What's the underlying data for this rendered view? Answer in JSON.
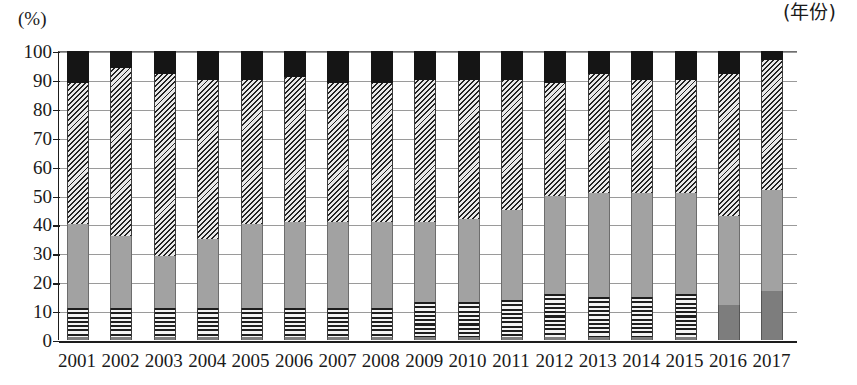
{
  "chart_data": {
    "type": "bar",
    "stacked": true,
    "title": "",
    "subtitle": "",
    "xlabel": "(年份)",
    "ylabel": "(%)",
    "ylim": [
      0,
      100
    ],
    "yticks": [
      0,
      10,
      20,
      30,
      40,
      50,
      60,
      70,
      80,
      90,
      100
    ],
    "ytick_labels": [
      "0",
      "10",
      "20",
      "30",
      "40",
      "50",
      "60",
      "70",
      "80",
      "90",
      "100"
    ],
    "grid": true,
    "legend": "none",
    "categories": [
      "2001",
      "2002",
      "2003",
      "2004",
      "2005",
      "2006",
      "2007",
      "2008",
      "2009",
      "2010",
      "2011",
      "2012",
      "2013",
      "2014",
      "2015",
      "2016",
      "2017"
    ],
    "series": [
      {
        "name": "bottom-dark-gray",
        "pattern": "solid-dark-gray",
        "color": "#7d7d7d",
        "values": [
          1,
          1,
          1,
          1,
          1,
          1,
          1,
          1,
          1,
          1,
          1,
          1,
          1,
          1,
          1,
          12,
          17
        ]
      },
      {
        "name": "horizontal-stripe",
        "pattern": "horizontal-stripes",
        "color": "#1e1e1e",
        "values": [
          10,
          10,
          10,
          10,
          10,
          10,
          10,
          10,
          12,
          12,
          13,
          15,
          14,
          14,
          15,
          0,
          0
        ]
      },
      {
        "name": "mid-gray",
        "pattern": "solid-gray",
        "color": "#a2a2a2",
        "values": [
          29,
          25,
          18,
          24,
          29,
          30,
          30,
          30,
          28,
          29,
          31,
          34,
          36,
          36,
          35,
          31,
          35
        ]
      },
      {
        "name": "diagonal-hatch",
        "pattern": "diagonal-hatch",
        "color": "#232323",
        "values": [
          49,
          58,
          63,
          55,
          50,
          50,
          48,
          48,
          49,
          48,
          45,
          39,
          41,
          39,
          39,
          49,
          45
        ]
      },
      {
        "name": "black-top",
        "pattern": "solid-black",
        "color": "#151515",
        "values": [
          11,
          6,
          8,
          10,
          10,
          9,
          11,
          11,
          10,
          10,
          10,
          11,
          8,
          10,
          10,
          8,
          3
        ]
      }
    ],
    "segment_tops": {
      "2001": [
        1,
        11,
        40,
        89,
        100
      ],
      "2002": [
        1,
        11,
        36,
        94,
        100
      ],
      "2003": [
        1,
        11,
        29,
        92,
        100
      ],
      "2004": [
        1,
        11,
        35,
        90,
        100
      ],
      "2005": [
        1,
        11,
        40,
        90,
        100
      ],
      "2006": [
        1,
        11,
        41,
        91,
        100
      ],
      "2007": [
        1,
        11,
        41,
        89,
        100
      ],
      "2008": [
        1,
        11,
        41,
        89,
        100
      ],
      "2009": [
        1,
        13,
        41,
        90,
        100
      ],
      "2010": [
        1,
        13,
        42,
        90,
        100
      ],
      "2011": [
        1,
        14,
        45,
        90,
        100
      ],
      "2012": [
        1,
        16,
        50,
        89,
        100
      ],
      "2013": [
        1,
        15,
        51,
        92,
        100
      ],
      "2014": [
        1,
        15,
        51,
        90,
        100
      ],
      "2015": [
        1,
        16,
        51,
        90,
        100
      ],
      "2016": [
        12,
        12,
        43,
        92,
        100
      ],
      "2017": [
        17,
        17,
        52,
        97,
        100
      ]
    }
  },
  "axis": {
    "unit_label": "(%)",
    "x_axis_title": "(年份)"
  }
}
